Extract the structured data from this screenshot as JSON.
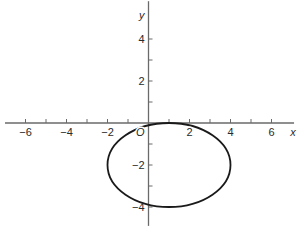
{
  "chart_data": {
    "type": "line",
    "title": "",
    "xlabel": "x",
    "ylabel": "y",
    "origin_label": "O",
    "xlim": [
      -7,
      7.1
    ],
    "ylim": [
      -4.9,
      5.8
    ],
    "grid": false,
    "legend": null,
    "x_ticks": [
      -6,
      -5,
      -4,
      -3,
      -2,
      -1,
      1,
      2,
      3,
      4,
      5,
      6
    ],
    "x_tick_labels": [
      "-6",
      "-4",
      "-2",
      "2",
      "4",
      "6"
    ],
    "x_tick_label_values": [
      -6,
      -4,
      -2,
      2,
      4,
      6
    ],
    "y_ticks": [
      -4,
      -3,
      -2,
      -1,
      1,
      2,
      3,
      4
    ],
    "y_tick_labels": [
      "4",
      "2",
      "-2",
      "-4"
    ],
    "y_tick_label_values": [
      4,
      2,
      -2,
      -4
    ],
    "series": [
      {
        "name": "ellipse",
        "shape": "ellipse",
        "center": [
          1,
          -2
        ],
        "semi_axis_x": 3,
        "semi_axis_y": 2,
        "equation": "(x-1)^2/9 + (y+2)^2/4 = 1",
        "extent_x": [
          -2,
          4
        ],
        "extent_y": [
          -4,
          0
        ],
        "color": "#1a1a1a"
      }
    ]
  },
  "colors": {
    "axis": "#6a6a6a",
    "curve": "#1a1a1a",
    "text": "#2a2a2a",
    "background": "#ffffff"
  }
}
